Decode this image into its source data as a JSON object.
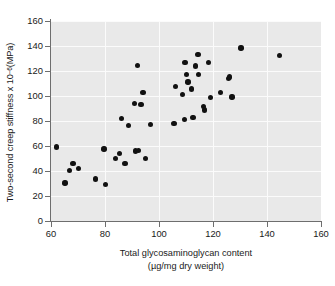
{
  "chart_data": {
    "type": "scatter",
    "title": "",
    "xlabel": "Total glycosaminoglycan content",
    "xlabel_line2": "(µg/mg dry weight)",
    "ylabel_prefix": "Two-second creep stiffness x 10",
    "ylabel_exponent": "−6",
    "ylabel_suffix": " (MPa)",
    "xlim": [
      60,
      160
    ],
    "ylim": [
      0,
      160
    ],
    "xticks": [
      60,
      80,
      100,
      120,
      140,
      160
    ],
    "yticks": [
      0,
      20,
      40,
      60,
      80,
      100,
      120,
      140,
      160
    ],
    "grid": true,
    "grid_color": "#fbfbfb",
    "plot_background": "#e9e9e9",
    "marker_color": "#111111",
    "axis_color": "#6e6e6e",
    "legend": null,
    "points": [
      [
        62.0,
        59.2
      ],
      [
        65.2,
        30.3
      ],
      [
        66.8,
        40.5
      ],
      [
        68.2,
        46.2
      ],
      [
        70.2,
        42.0
      ],
      [
        76.4,
        33.7
      ],
      [
        79.6,
        57.6
      ],
      [
        80.2,
        29.2
      ],
      [
        83.8,
        50.0
      ],
      [
        85.4,
        54.2
      ],
      [
        86.2,
        82.0
      ],
      [
        87.4,
        46.1
      ],
      [
        88.6,
        76.4
      ],
      [
        91.0,
        93.9
      ],
      [
        91.4,
        55.9
      ],
      [
        92.0,
        124.6
      ],
      [
        92.4,
        56.2
      ],
      [
        93.4,
        93.4
      ],
      [
        94.0,
        102.6
      ],
      [
        95.0,
        50.2
      ],
      [
        96.8,
        77.3
      ],
      [
        105.6,
        77.9
      ],
      [
        106.2,
        107.5
      ],
      [
        108.8,
        101.3
      ],
      [
        109.4,
        81.2
      ],
      [
        109.6,
        127.0
      ],
      [
        110.2,
        117.0
      ],
      [
        110.8,
        111.2
      ],
      [
        112.0,
        105.6
      ],
      [
        112.6,
        82.6
      ],
      [
        113.6,
        124.0
      ],
      [
        114.4,
        133.0
      ],
      [
        114.6,
        117.0
      ],
      [
        116.4,
        91.8
      ],
      [
        116.8,
        88.9
      ],
      [
        118.4,
        126.6
      ],
      [
        119.0,
        98.6
      ],
      [
        122.8,
        103.0
      ],
      [
        125.8,
        114.2
      ],
      [
        126.2,
        115.2
      ],
      [
        127.0,
        99.2
      ],
      [
        130.4,
        138.4
      ],
      [
        144.6,
        132.4
      ]
    ]
  }
}
